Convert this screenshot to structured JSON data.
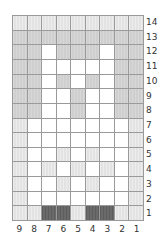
{
  "chart": {
    "columns": 9,
    "rows": 14,
    "column_labels": [
      "9",
      "8",
      "7",
      "6",
      "5",
      "4",
      "3",
      "2",
      "1"
    ],
    "row_labels": [
      "14",
      "13",
      "12",
      "11",
      "10",
      "9",
      "8",
      "7",
      "6",
      "5",
      "4",
      "3",
      "2",
      "1"
    ],
    "legend_colors": {
      "W": "#ffffff",
      "L": "#e3e3e3",
      "G": "#cfcfcf",
      "D": "#6a6a6a"
    },
    "cells": [
      [
        "L",
        "L",
        "L",
        "L",
        "L",
        "L",
        "L",
        "L",
        "L"
      ],
      [
        "G",
        "G",
        "G",
        "G",
        "G",
        "G",
        "G",
        "G",
        "G"
      ],
      [
        "G",
        "G",
        "W",
        "G",
        "G",
        "G",
        "W",
        "G",
        "G"
      ],
      [
        "G",
        "G",
        "W",
        "W",
        "W",
        "W",
        "W",
        "G",
        "G"
      ],
      [
        "G",
        "G",
        "W",
        "G",
        "W",
        "G",
        "W",
        "G",
        "G"
      ],
      [
        "G",
        "G",
        "W",
        "W",
        "G",
        "W",
        "W",
        "G",
        "G"
      ],
      [
        "G",
        "G",
        "W",
        "W",
        "G",
        "W",
        "W",
        "G",
        "G"
      ],
      [
        "L",
        "W",
        "W",
        "W",
        "W",
        "W",
        "W",
        "W",
        "L"
      ],
      [
        "L",
        "W",
        "W",
        "W",
        "W",
        "W",
        "W",
        "W",
        "L"
      ],
      [
        "L",
        "W",
        "W",
        "L",
        "W",
        "L",
        "W",
        "W",
        "L"
      ],
      [
        "L",
        "W",
        "L",
        "W",
        "L",
        "W",
        "L",
        "W",
        "L"
      ],
      [
        "L",
        "W",
        "W",
        "L",
        "W",
        "L",
        "W",
        "W",
        "L"
      ],
      [
        "L",
        "W",
        "W",
        "W",
        "W",
        "W",
        "W",
        "W",
        "L"
      ],
      [
        "L",
        "L",
        "D",
        "D",
        "L",
        "D",
        "D",
        "L",
        "L"
      ]
    ]
  }
}
